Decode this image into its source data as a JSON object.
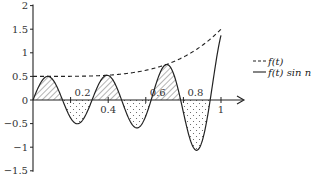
{
  "chart_data": {
    "type": "line",
    "title": "",
    "xlabel": "",
    "ylabel": "",
    "xlim": [
      0,
      1
    ],
    "ylim": [
      -1.5,
      2
    ],
    "x_ticks": [
      0.2,
      0.4,
      0.6,
      0.8,
      1
    ],
    "x_tick_labels": [
      "0.2",
      "0.4",
      "0.6",
      "0.8",
      "1"
    ],
    "y_ticks": [
      2,
      1.5,
      1,
      0.5,
      0,
      -0.5,
      -1,
      -1.5
    ],
    "y_tick_labels": [
      "2",
      "1.5",
      "1",
      "0.5",
      "0",
      "−0.5",
      "−1",
      "−1.5"
    ],
    "grid": false,
    "legend_position": "right",
    "shading": {
      "positive": "hatched",
      "negative": "dotted"
    },
    "series": [
      {
        "name": "f(t)",
        "style": "dashed",
        "x": [
          0,
          0.1,
          0.2,
          0.3,
          0.4,
          0.5,
          0.6,
          0.7,
          0.8,
          0.9,
          1.0
        ],
        "values": [
          0.5,
          0.5,
          0.5,
          0.51,
          0.53,
          0.56,
          0.63,
          0.74,
          0.91,
          1.16,
          1.5
        ]
      },
      {
        "name": "f(t) sin n",
        "style": "solid",
        "x": [
          0,
          0.08,
          0.157,
          0.236,
          0.314,
          0.393,
          0.471,
          0.55,
          0.628,
          0.707,
          0.785,
          0.864,
          0.942,
          1.0
        ],
        "values": [
          0,
          0.5,
          0,
          -0.5,
          0,
          0.52,
          0,
          -0.59,
          0,
          0.75,
          0,
          -1.06,
          0,
          1.37
        ]
      }
    ]
  },
  "legend": {
    "items": [
      {
        "label": "f(t)",
        "style": "dashed"
      },
      {
        "label": "f(t) sin n",
        "style": "solid"
      }
    ]
  }
}
